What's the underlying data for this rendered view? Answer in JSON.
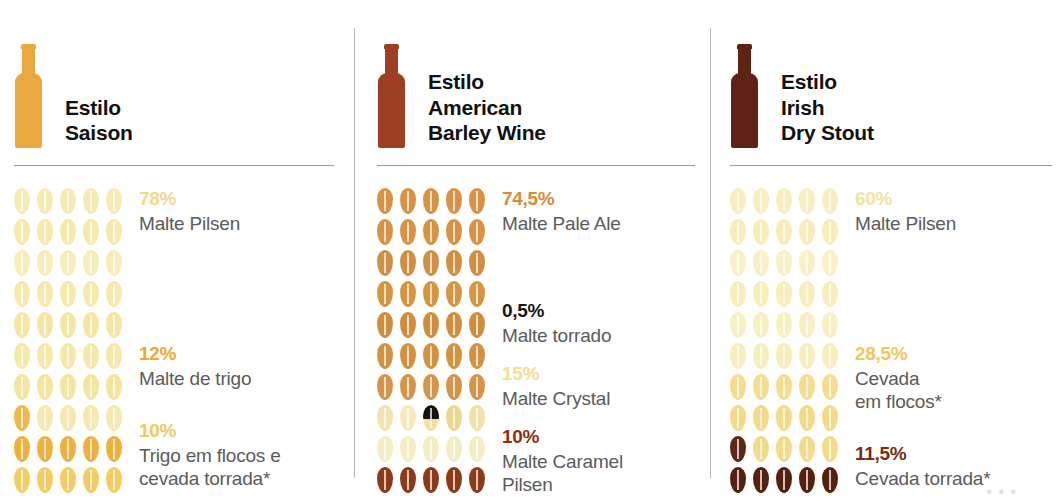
{
  "chart_data": {
    "type": "bar",
    "xlabel": "",
    "ylabel": "",
    "unit": "%",
    "pictogram": {
      "symbol": "grain-icon",
      "grains_per_row": 5,
      "rows_per_column": 10,
      "total_grains": 50,
      "grain_value_percent": 2
    },
    "series": [
      {
        "name": "Estilo Saison",
        "categories": [
          "Malte Pilsen",
          "Malte de trigo",
          "Trigo em flocos e cevada torrada*"
        ],
        "values": [
          78,
          12,
          10
        ]
      },
      {
        "name": "Estilo American Barley Wine",
        "categories": [
          "Malte Pale Ale",
          "Malte torrado",
          "Malte Crystal",
          "Malte Caramel Pilsen"
        ],
        "values": [
          74.5,
          0.5,
          15,
          10
        ]
      },
      {
        "name": "Estilo Irish Dry Stout",
        "categories": [
          "Malte Pilsen",
          "Cevada em flocos*",
          "Cevada torrada*"
        ],
        "values": [
          60,
          28.5,
          11.5
        ]
      }
    ]
  },
  "columns": [
    {
      "id": "saison",
      "bottle_color": "#e9a940",
      "title_lines": [
        "Estilo",
        "Saison"
      ],
      "legend": [
        {
          "pct": "78%",
          "pct_color": "#f0d98a",
          "name_lines": [
            "Malte Pilsen"
          ],
          "top": 0
        },
        {
          "pct": "12%",
          "pct_color": "#eda72f",
          "name_lines": [
            "Malte de trigo"
          ],
          "top": 155
        },
        {
          "pct": "10%",
          "pct_color": "#f2c960",
          "name_lines": [
            "Trigo em flocos e",
            "cevada torrada*"
          ],
          "top": 232
        }
      ],
      "grain_rows": [
        [
          "#f7eab4",
          "#f7eab4",
          "#f7eab4",
          "#f7eab4",
          "#f7eab4"
        ],
        [
          "#f7e8ac",
          "#f7e8ac",
          "#f7e8ac",
          "#f7e8ac",
          "#f7e8ac"
        ],
        [
          "#f8ecb8",
          "#f8ecb8",
          "#f8ecb8",
          "#f8ecb8",
          "#f8ecb8"
        ],
        [
          "#f7e9ae",
          "#f7e9ae",
          "#f7e9ae",
          "#f7e9ae",
          "#f7e9ae"
        ],
        [
          "#f6e6a4",
          "#f6e6a4",
          "#f6e6a4",
          "#f6e6a4",
          "#f6e6a4"
        ],
        [
          "#f7e8a8",
          "#f7e8a8",
          "#f7e8a8",
          "#f7e8a8",
          "#f7e8a8"
        ],
        [
          "#f6e59c",
          "#f6e59c",
          "#f6e59c",
          "#f6e59c",
          "#f6e59c"
        ],
        [
          "#f0b84a",
          "#f6e8ae",
          "#f6e8ae",
          "#f6e8ae",
          "#f6e8ae"
        ],
        [
          "#efb13c",
          "#efb13c",
          "#efb13c",
          "#efb13c",
          "#efb13c"
        ],
        [
          "#f3cc64",
          "#f3cc64",
          "#f3cc64",
          "#f3cc64",
          "#f3cc64"
        ]
      ]
    },
    {
      "id": "american-barley-wine",
      "bottle_color": "#9c3f22",
      "title_lines": [
        "Estilo",
        "American",
        "Barley Wine"
      ],
      "legend": [
        {
          "pct": "74,5%",
          "pct_color": "#d88b35",
          "name_lines": [
            "Malte Pale Ale"
          ],
          "top": 0
        },
        {
          "pct": "0,5%",
          "pct_color": "#161616",
          "name_lines": [
            "Malte torrado"
          ],
          "top": 112
        },
        {
          "pct": "15%",
          "pct_color": "#f5dd96",
          "name_lines": [
            "Malte Crystal"
          ],
          "top": 175
        },
        {
          "pct": "10%",
          "pct_color": "#8e2f12",
          "name_lines": [
            "Malte Caramel",
            "Pilsen"
          ],
          "top": 238
        }
      ],
      "grain_rows": [
        [
          "#d69344",
          "#d69344",
          "#d69344",
          "#d69344",
          "#d69344"
        ],
        [
          "#d69344",
          "#d69344",
          "#d69344",
          "#d69344",
          "#d69344"
        ],
        [
          "#d08f42",
          "#d08f42",
          "#d08f42",
          "#d08f42",
          "#d08f42"
        ],
        [
          "#d6963f",
          "#d6963f",
          "#d6963f",
          "#d6963f",
          "#d6963f"
        ],
        [
          "#cf8d3e",
          "#cf8d3e",
          "#cf8d3e",
          "#cf8d3e",
          "#cf8d3e"
        ],
        [
          "#d29240",
          "#d29240",
          "#d29240",
          "#d29240",
          "#d29240"
        ],
        [
          "#d4954a",
          "#d4954a",
          "#d4954a",
          "#d4954a",
          "#d4954a"
        ],
        [
          "#f3e3ae",
          "#f6eabd",
          "#SPLIT",
          "#edd690",
          "#f2e1a6"
        ],
        [
          "#f6ecc4",
          "#f6ecc4",
          "#f6ecc4",
          "#f6ecc4",
          "#f6ecc4"
        ],
        [
          "#8c3a18",
          "#8c3a18",
          "#8c3a18",
          "#8c3a18",
          "#8c3a18"
        ]
      ]
    },
    {
      "id": "irish-dry-stout",
      "bottle_color": "#5e2314",
      "title_lines": [
        "Estilo",
        "Irish",
        "Dry Stout"
      ],
      "legend": [
        {
          "pct": "60%",
          "pct_color": "#f3e2a0",
          "name_lines": [
            "Malte Pilsen"
          ],
          "top": 0
        },
        {
          "pct": "28,5%",
          "pct_color": "#f0c75c",
          "name_lines": [
            "Cevada",
            "em flocos*"
          ],
          "top": 155
        },
        {
          "pct": "11,5%",
          "pct_color": "#7a2a12",
          "name_lines": [
            "Cevada torrada*"
          ],
          "top": 255
        }
      ],
      "grain_rows": [
        [
          "#f8eebe",
          "#f8eebe",
          "#f8eebe",
          "#f8eebe",
          "#f8eebe"
        ],
        [
          "#f8edb8",
          "#f8edb8",
          "#f8edb8",
          "#f8edb8",
          "#f8edb8"
        ],
        [
          "#f9f0c6",
          "#f9f0c6",
          "#f9f0c6",
          "#f9f0c6",
          "#f9f0c6"
        ],
        [
          "#f8eeba",
          "#f8eeba",
          "#f8eeba",
          "#f8eeba",
          "#f8eeba"
        ],
        [
          "#f9f0c2",
          "#f9f0c2",
          "#f9f0c2",
          "#f9f0c2",
          "#f9f0c2"
        ],
        [
          "#f8edbc",
          "#f8edbc",
          "#f8edbc",
          "#f8edbc",
          "#f8edbc"
        ],
        [
          "#f5dc8e",
          "#f5dc8e",
          "#f5dc8e",
          "#f5dc8e",
          "#f5dc8e"
        ],
        [
          "#f4da86",
          "#f4da86",
          "#f4da86",
          "#f4da86",
          "#f4da86"
        ],
        [
          "#5e2613",
          "#f4db8a",
          "#f4db8a",
          "#f4db8a",
          "#f4db8a"
        ],
        [
          "#55210f",
          "#55210f",
          "#55210f",
          "#55210f",
          "#55210f"
        ]
      ]
    }
  ],
  "footnote_ghost": "* * *"
}
